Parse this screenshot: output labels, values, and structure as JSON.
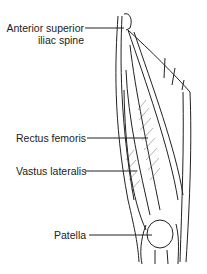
{
  "figure": {
    "labels": [
      {
        "id": "asis",
        "line1": "Anterior superior",
        "line2": "iliac spine"
      },
      {
        "id": "rectus",
        "line1": "Rectus femoris"
      },
      {
        "id": "vastus",
        "line1": "Vastus lateralis"
      },
      {
        "id": "patella",
        "line1": "Patella"
      }
    ]
  }
}
